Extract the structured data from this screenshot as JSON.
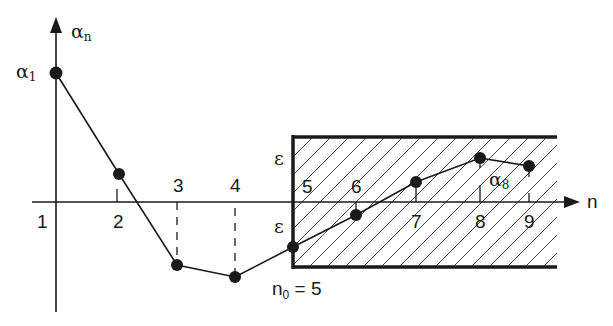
{
  "colors": {
    "ink": "#1a1a1a",
    "background": "#ffffff",
    "hatch": "#333333"
  },
  "axes": {
    "x_label": "n",
    "y_label_base": "α",
    "y_label_sub": "n",
    "x_tick_labels": [
      "1",
      "2",
      "3",
      "4",
      "5",
      "6",
      "7",
      "8",
      "9"
    ]
  },
  "points": [
    {
      "n": 1,
      "x": 56,
      "y": 73
    },
    {
      "n": 2,
      "x": 119,
      "y": 174
    },
    {
      "n": 3,
      "x": 177,
      "y": 265
    },
    {
      "n": 4,
      "x": 235,
      "y": 277
    },
    {
      "n": 5,
      "x": 293,
      "y": 247
    },
    {
      "n": 6,
      "x": 356,
      "y": 215
    },
    {
      "n": 7,
      "x": 416,
      "y": 182
    },
    {
      "n": 8,
      "x": 480,
      "y": 158
    },
    {
      "n": 9,
      "x": 529,
      "y": 166
    }
  ],
  "annotations": {
    "alpha1_base": "α",
    "alpha1_sub": "1",
    "alpha8_base": "α",
    "alpha8_sub": "8",
    "epsilon_upper": "ε",
    "epsilon_lower": "ε",
    "n0_base": "n",
    "n0_sub": "0",
    "n0_rest": " = 5"
  },
  "epsilon_band": {
    "start_n": 5,
    "left_x": 293,
    "right_x": 557,
    "top_y": 137,
    "bottom_y": 267
  }
}
